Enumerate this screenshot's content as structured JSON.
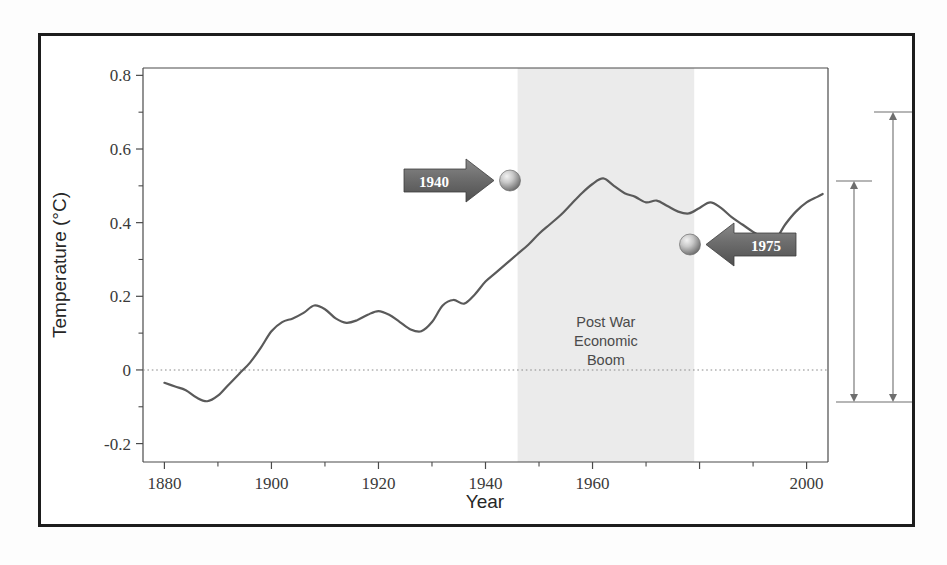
{
  "figure": {
    "background_color": "#ffffff",
    "frame_color": "#1d1d1d"
  },
  "chart_data": {
    "type": "line",
    "title": "",
    "subtitle": "",
    "xlabel": "Year",
    "ylabel": "Temperature (°C)",
    "xlim": [
      1876,
      2004
    ],
    "ylim": [
      -0.25,
      0.82
    ],
    "xticks": [
      1880,
      1900,
      1920,
      1940,
      1960,
      2000
    ],
    "xtick_labels": [
      "1880",
      "1900",
      "1920",
      "1940",
      "1960",
      "2000"
    ],
    "xticks_all": [
      1880,
      1900,
      1920,
      1940,
      1960,
      1980,
      2000
    ],
    "xminor_ticks": [
      1890,
      1910,
      1930,
      1950,
      1970,
      1990
    ],
    "yticks": [
      -0.2,
      0,
      0.2,
      0.4,
      0.6,
      0.8
    ],
    "ytick_labels": [
      "-0.2",
      "0",
      "0.2",
      "0.4",
      "0.6",
      "0.8"
    ],
    "yminor_ticks": [
      -0.1,
      0.1,
      0.3,
      0.5,
      0.7
    ],
    "grid": false,
    "zero_line": {
      "value": 0,
      "style": "dotted",
      "color": "#7a7a7a"
    },
    "legend": null,
    "line_color": "#5a5a5a",
    "line_width": 2.2,
    "series": [
      {
        "name": "Global mean temperature anomaly",
        "x": [
          1880,
          1882,
          1884,
          1886,
          1888,
          1890,
          1892,
          1894,
          1896,
          1898,
          1900,
          1902,
          1904,
          1906,
          1908,
          1910,
          1912,
          1914,
          1916,
          1918,
          1920,
          1922,
          1924,
          1926,
          1928,
          1930,
          1932,
          1934,
          1936,
          1938,
          1940,
          1942,
          1944,
          1946,
          1948,
          1950,
          1952,
          1954,
          1956,
          1958,
          1960,
          1962,
          1964,
          1966,
          1968,
          1970,
          1972,
          1974,
          1976,
          1978,
          1980,
          1982,
          1984,
          1986,
          1988,
          1990,
          1992,
          1994,
          1996,
          1998,
          2000,
          2002,
          2003
        ],
        "y": [
          -0.035,
          -0.045,
          -0.055,
          -0.075,
          -0.085,
          -0.07,
          -0.04,
          -0.01,
          0.02,
          0.06,
          0.105,
          0.13,
          0.14,
          0.155,
          0.175,
          0.165,
          0.14,
          0.128,
          0.135,
          0.15,
          0.16,
          0.15,
          0.13,
          0.11,
          0.105,
          0.13,
          0.175,
          0.19,
          0.18,
          0.205,
          0.24,
          0.265,
          0.29,
          0.315,
          0.34,
          0.37,
          0.395,
          0.42,
          0.45,
          0.48,
          0.505,
          0.52,
          0.5,
          0.48,
          0.47,
          0.455,
          0.46,
          0.445,
          0.43,
          0.425,
          0.44,
          0.455,
          0.44,
          0.415,
          0.395,
          0.375,
          0.36,
          0.352,
          0.395,
          0.43,
          0.455,
          0.47,
          0.478
        ]
      }
    ],
    "shaded_region": {
      "label_lines": [
        "Post War",
        "Economic",
        "Boom"
      ],
      "x_start": 1946,
      "x_end": 1979,
      "fill_color": "#ebebeb"
    },
    "annotations": [
      {
        "label": "1940",
        "x": 1946,
        "y": 0.52,
        "arrow_direction": "right",
        "marker": "sphere",
        "box_color": "#676767",
        "text_color": "#ffffff"
      },
      {
        "label": "1975",
        "x": 1979,
        "y": 0.352,
        "arrow_direction": "left",
        "marker": "sphere",
        "box_color": "#676767",
        "text_color": "#ffffff"
      }
    ],
    "range_brackets": [
      {
        "name": "inner-range",
        "y_top": 0.52,
        "y_bottom": -0.055
      },
      {
        "name": "outer-range",
        "y_top": 0.7,
        "y_bottom": -0.055
      }
    ]
  }
}
